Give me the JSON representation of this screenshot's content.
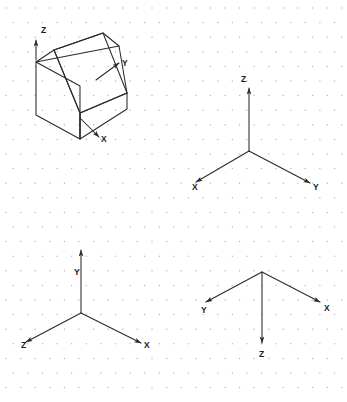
{
  "page": {
    "background_color": "#ffffff",
    "line_color": "#2a2a2a",
    "grid_dot_color": "#b9b9c4",
    "width": 347,
    "height": 402
  },
  "figures": [
    {
      "id": "wedge-figure",
      "name": "isometric-wedge-solid",
      "description": "Isometric pictorial of an inclined-face wedge block with axis arrows",
      "axes": [
        {
          "label": "Z",
          "direction": "up",
          "label_x": 41,
          "label_y": 33
        },
        {
          "label": "Y",
          "direction": "upper-right",
          "label_x": 122,
          "label_y": 66
        },
        {
          "label": "X",
          "direction": "lower-right",
          "label_x": 101,
          "label_y": 142
        }
      ]
    },
    {
      "id": "triad-top-right",
      "name": "axis-triad-z-up",
      "description": "Coordinate triad with Z vertical up, X to lower left, Y to lower right",
      "axes": [
        {
          "label": "Z",
          "direction": "up",
          "label_x": 241,
          "label_y": 82
        },
        {
          "label": "X",
          "direction": "lower-left",
          "label_x": 192,
          "label_y": 190
        },
        {
          "label": "Y",
          "direction": "lower-right",
          "label_x": 313,
          "label_y": 190
        }
      ]
    },
    {
      "id": "triad-bottom-left",
      "name": "axis-triad-y-up",
      "description": "Coordinate triad with Y vertical up, Z to lower left, X to lower right",
      "axes": [
        {
          "label": "Y",
          "direction": "up",
          "label_x": 74,
          "label_y": 275
        },
        {
          "label": "Z",
          "direction": "lower-left",
          "label_x": 21,
          "label_y": 348
        },
        {
          "label": "X",
          "direction": "lower-right",
          "label_x": 144,
          "label_y": 348
        }
      ]
    },
    {
      "id": "triad-bottom-right",
      "name": "axis-triad-z-down",
      "description": "Coordinate triad with Z vertical down, Y to upper left, X to upper right",
      "axes": [
        {
          "label": "Z",
          "direction": "down",
          "label_x": 264,
          "label_y": 355
        },
        {
          "label": "Y",
          "direction": "upper-left",
          "label_x": 203,
          "label_y": 312
        },
        {
          "label": "X",
          "direction": "upper-right",
          "label_x": 326,
          "label_y": 310
        }
      ]
    }
  ],
  "grid": {
    "type": "isometric-dot",
    "spacing_x": 14.6,
    "spacing_y": 14.6,
    "dot_radius": 0.75
  }
}
